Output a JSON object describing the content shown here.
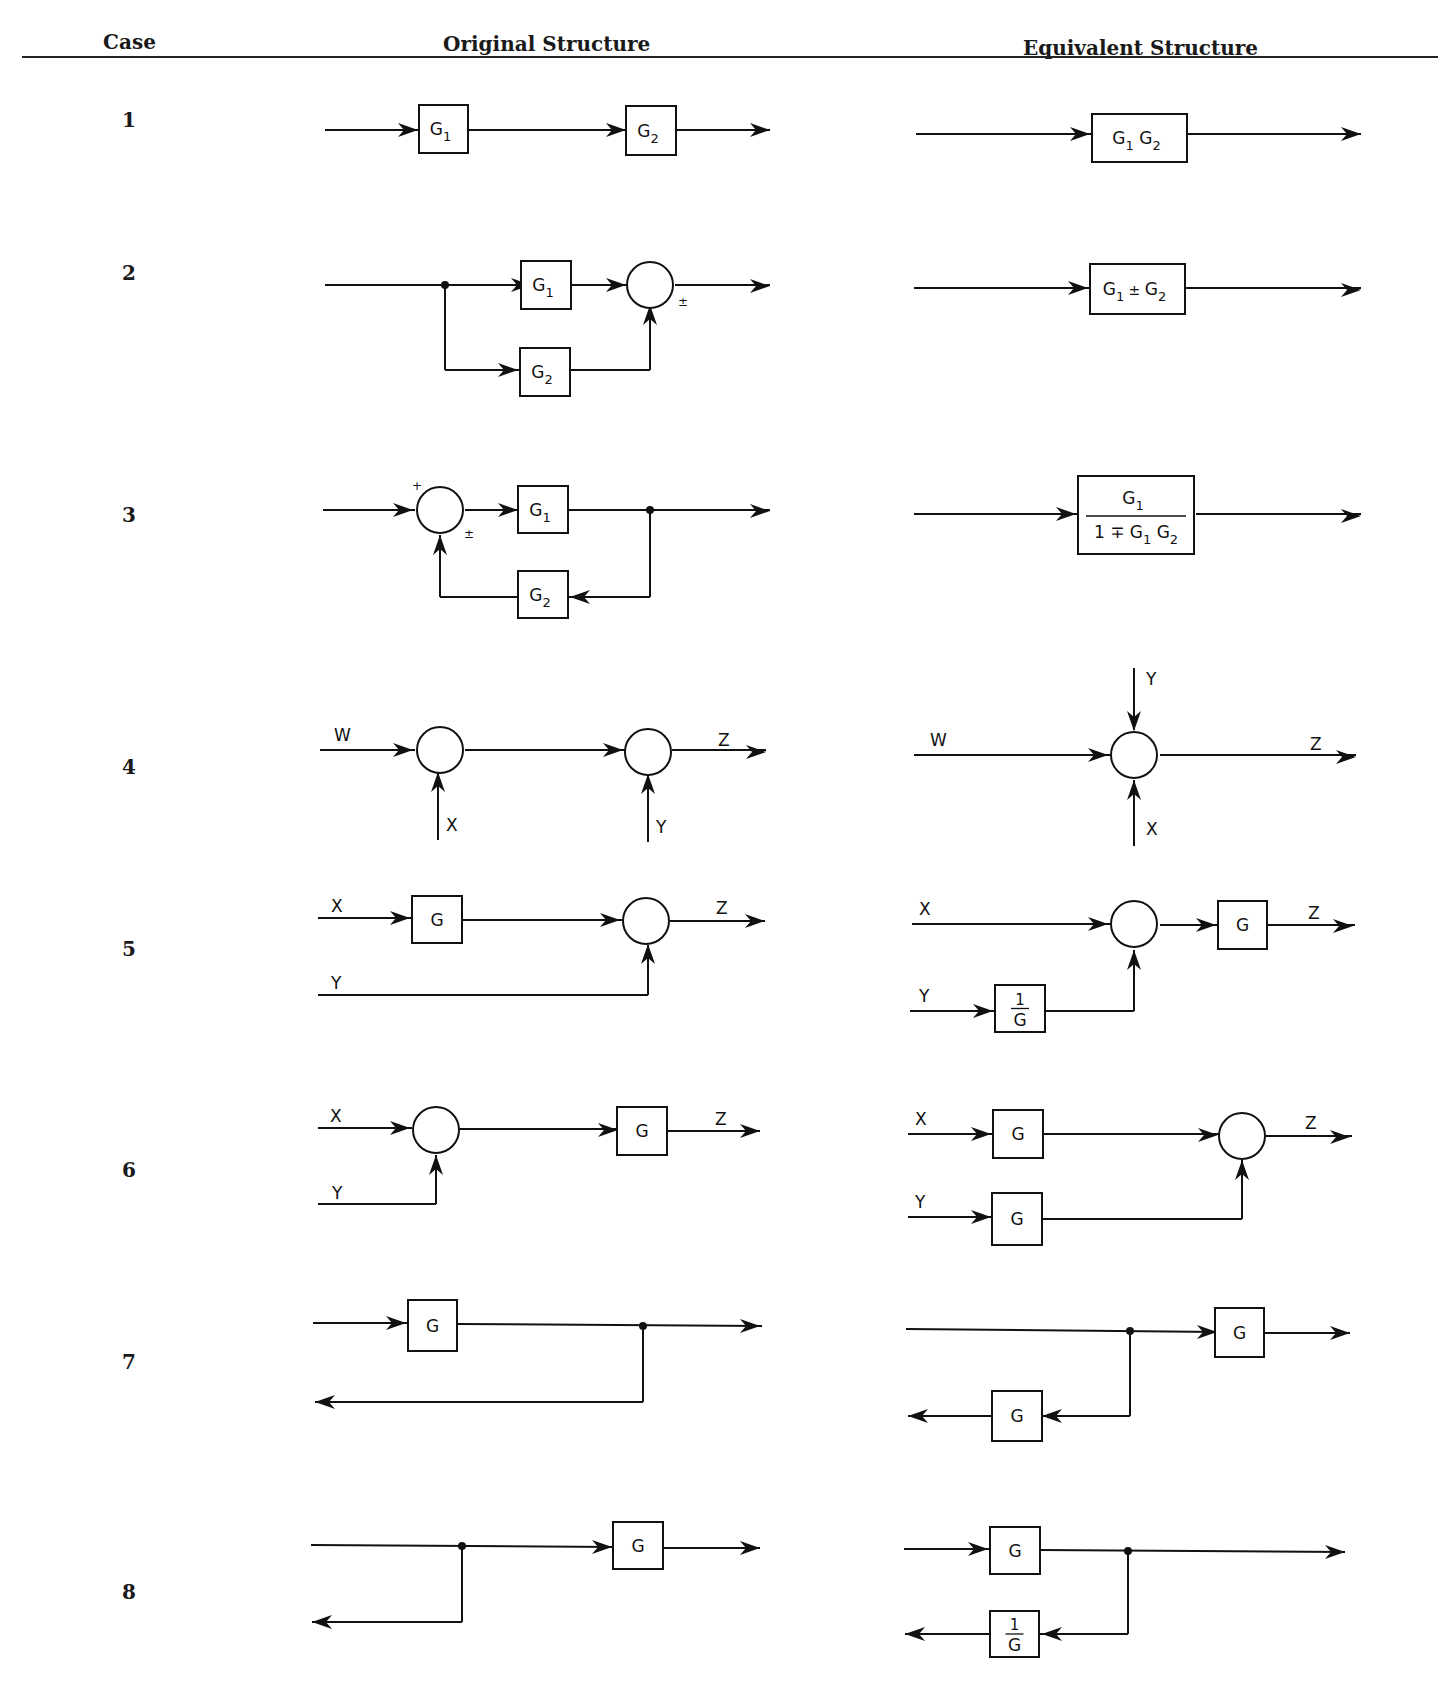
{
  "header": {
    "case_label": "Case",
    "original_label": "Original Structure",
    "equivalent_label": "Equivalent Structure"
  },
  "cases": [
    {
      "number": "1",
      "y": 122
    },
    {
      "number": "2",
      "y": 275
    },
    {
      "number": "3",
      "y": 517
    },
    {
      "number": "4",
      "y": 769
    },
    {
      "number": "5",
      "y": 951
    },
    {
      "number": "6",
      "y": 1172
    },
    {
      "number": "7",
      "y": 1364
    },
    {
      "number": "8",
      "y": 1594
    }
  ],
  "diagram": {
    "stroke": "#111111",
    "lines": [
      [
        325,
        130,
        420,
        130
      ],
      [
        467,
        130,
        628,
        130
      ],
      [
        676,
        130,
        770,
        130
      ],
      [
        916,
        134,
        1092,
        134
      ],
      [
        1187,
        134,
        1361,
        134
      ],
      [
        325,
        285,
        533,
        285
      ],
      [
        445,
        285,
        445,
        370
      ],
      [
        445,
        370,
        520,
        370
      ],
      [
        568,
        285,
        628,
        285
      ],
      [
        567,
        370,
        650,
        370
      ],
      [
        650,
        370,
        650,
        318
      ],
      [
        675,
        285,
        770,
        285
      ],
      [
        914,
        288,
        1090,
        288
      ],
      [
        1185,
        288,
        1361,
        288
      ],
      [
        323,
        510,
        415,
        510
      ],
      [
        465,
        510,
        520,
        510
      ],
      [
        568,
        510,
        770,
        510
      ],
      [
        650,
        510,
        650,
        597
      ],
      [
        650,
        597,
        568,
        597
      ],
      [
        520,
        597,
        440,
        597
      ],
      [
        440,
        597,
        440,
        535
      ],
      [
        914,
        514,
        1078,
        514
      ],
      [
        1196,
        514,
        1361,
        514
      ],
      [
        320,
        750,
        415,
        750
      ],
      [
        465,
        750,
        625,
        750
      ],
      [
        672,
        750,
        766,
        750
      ],
      [
        438,
        840,
        438,
        773
      ],
      [
        648,
        842,
        648,
        775
      ],
      [
        914,
        755,
        1110,
        755
      ],
      [
        1160,
        755,
        1356,
        755
      ],
      [
        1134,
        668,
        1134,
        730
      ],
      [
        1134,
        846,
        1134,
        780
      ],
      [
        318,
        918,
        412,
        918
      ],
      [
        463,
        920,
        622,
        920
      ],
      [
        670,
        921,
        765,
        921
      ],
      [
        318,
        995,
        648,
        995
      ],
      [
        648,
        995,
        648,
        945
      ],
      [
        912,
        924,
        1110,
        924
      ],
      [
        1160,
        925,
        1218,
        925
      ],
      [
        1267,
        925,
        1355,
        925
      ],
      [
        910,
        1011,
        995,
        1011
      ],
      [
        1045,
        1011,
        1134,
        1011
      ],
      [
        1134,
        1011,
        1134,
        950
      ],
      [
        318,
        1128,
        412,
        1128
      ],
      [
        458,
        1129,
        620,
        1129
      ],
      [
        667,
        1131,
        760,
        1131
      ],
      [
        318,
        1204,
        436,
        1204
      ],
      [
        436,
        1204,
        436,
        1155
      ],
      [
        908,
        1134,
        993,
        1134
      ],
      [
        1043,
        1134,
        1220,
        1134
      ],
      [
        1265,
        1136,
        1352,
        1136
      ],
      [
        908,
        1217,
        993,
        1217
      ],
      [
        1043,
        1219,
        1242,
        1219
      ],
      [
        1242,
        1219,
        1242,
        1160
      ],
      [
        313,
        1323,
        408,
        1323
      ],
      [
        457,
        1324,
        762,
        1326
      ],
      [
        643,
        1326,
        643,
        1402
      ],
      [
        643,
        1402,
        315,
        1402
      ],
      [
        906,
        1329,
        1219,
        1332
      ],
      [
        1265,
        1333,
        1350,
        1333
      ],
      [
        1130,
        1331,
        1130,
        1416
      ],
      [
        1130,
        1416,
        1040,
        1416
      ],
      [
        992,
        1416,
        908,
        1416
      ],
      [
        311,
        1545,
        614,
        1547
      ],
      [
        462,
        1546,
        462,
        1622
      ],
      [
        462,
        1622,
        312,
        1622
      ],
      [
        662,
        1548,
        760,
        1548
      ],
      [
        904,
        1549,
        990,
        1549
      ],
      [
        1040,
        1550,
        1345,
        1552
      ],
      [
        1128,
        1551,
        1128,
        1634
      ],
      [
        1128,
        1634,
        1040,
        1634
      ],
      [
        990,
        1634,
        905,
        1634
      ]
    ],
    "arrows": [
      [
        418,
        130,
        "r"
      ],
      [
        626,
        130,
        "r"
      ],
      [
        770,
        130,
        "r"
      ],
      [
        1090,
        134,
        "r"
      ],
      [
        1361,
        134,
        "r"
      ],
      [
        531,
        285,
        "r"
      ],
      [
        518,
        370,
        "r"
      ],
      [
        626,
        285,
        "r"
      ],
      [
        650,
        305,
        "u"
      ],
      [
        770,
        286,
        "r"
      ],
      [
        1088,
        288,
        "r"
      ],
      [
        1361,
        290,
        "r"
      ],
      [
        413,
        510,
        "r"
      ],
      [
        518,
        510,
        "r"
      ],
      [
        770,
        511,
        "r"
      ],
      [
        570,
        597,
        "l"
      ],
      [
        440,
        535,
        "u"
      ],
      [
        1076,
        514,
        "r"
      ],
      [
        1361,
        516,
        "r"
      ],
      [
        413,
        750,
        "r"
      ],
      [
        623,
        750,
        "r"
      ],
      [
        766,
        752,
        "r"
      ],
      [
        438,
        772,
        "u"
      ],
      [
        648,
        774,
        "u"
      ],
      [
        1108,
        755,
        "r"
      ],
      [
        1356,
        757,
        "r"
      ],
      [
        1134,
        731,
        "d"
      ],
      [
        1134,
        780,
        "u"
      ],
      [
        410,
        918,
        "r"
      ],
      [
        620,
        920,
        "r"
      ],
      [
        765,
        921,
        "r"
      ],
      [
        648,
        944,
        "u"
      ],
      [
        1108,
        924,
        "r"
      ],
      [
        1216,
        925,
        "r"
      ],
      [
        1353,
        926,
        "r"
      ],
      [
        993,
        1011,
        "r"
      ],
      [
        1134,
        950,
        "u"
      ],
      [
        410,
        1128,
        "r"
      ],
      [
        618,
        1130,
        "r"
      ],
      [
        760,
        1131,
        "r"
      ],
      [
        436,
        1155,
        "u"
      ],
      [
        991,
        1134,
        "r"
      ],
      [
        1218,
        1135,
        "r"
      ],
      [
        1350,
        1137,
        "r"
      ],
      [
        991,
        1217,
        "r"
      ],
      [
        1242,
        1160,
        "u"
      ],
      [
        406,
        1323,
        "r"
      ],
      [
        760,
        1326,
        "r"
      ],
      [
        315,
        1402,
        "l"
      ],
      [
        1217,
        1332,
        "r"
      ],
      [
        1350,
        1333,
        "r"
      ],
      [
        1042,
        1416,
        "l"
      ],
      [
        908,
        1416,
        "l"
      ],
      [
        612,
        1547,
        "r"
      ],
      [
        760,
        1548,
        "r"
      ],
      [
        312,
        1622,
        "l"
      ],
      [
        988,
        1549,
        "r"
      ],
      [
        1345,
        1552,
        "r"
      ],
      [
        1042,
        1634,
        "l"
      ],
      [
        905,
        1634,
        "l"
      ]
    ],
    "dots": [
      [
        445,
        285
      ],
      [
        650,
        510
      ],
      [
        643,
        1326
      ],
      [
        1130,
        1331
      ],
      [
        462,
        1546
      ],
      [
        1128,
        1551
      ]
    ],
    "circles": [
      [
        650,
        285,
        23
      ],
      [
        440,
        510,
        23
      ],
      [
        440,
        750,
        23
      ],
      [
        648,
        752,
        23
      ],
      [
        1134,
        755,
        23
      ],
      [
        646,
        921,
        23
      ],
      [
        1134,
        924,
        23
      ],
      [
        436,
        1130,
        23
      ],
      [
        1242,
        1136,
        23
      ]
    ],
    "boxes": [
      {
        "x": 419,
        "y": 105,
        "w": 49,
        "h": 48,
        "main": "G",
        "sub": "1"
      },
      {
        "x": 626,
        "y": 106,
        "w": 50,
        "h": 49,
        "main": "G",
        "sub": "2"
      },
      {
        "x": 1092,
        "y": 114,
        "w": 95,
        "h": 48,
        "main": "G",
        "sub": "1",
        "main2": "G",
        "sub2": "2"
      },
      {
        "x": 521,
        "y": 261,
        "w": 50,
        "h": 48,
        "main": "G",
        "sub": "1"
      },
      {
        "x": 520,
        "y": 348,
        "w": 50,
        "h": 48,
        "main": "G",
        "sub": "2"
      },
      {
        "x": 1090,
        "y": 264,
        "w": 95,
        "h": 50,
        "main": "G",
        "sub": "1",
        "mid": " ± ",
        "main2": "G",
        "sub2": "2"
      },
      {
        "x": 518,
        "y": 486,
        "w": 50,
        "h": 47,
        "main": "G",
        "sub": "1"
      },
      {
        "x": 518,
        "y": 571,
        "w": 50,
        "h": 47,
        "main": "G",
        "sub": "2"
      },
      {
        "x": 412,
        "y": 896,
        "w": 50,
        "h": 47,
        "main": "G"
      },
      {
        "x": 1218,
        "y": 901,
        "w": 49,
        "h": 48,
        "main": "G"
      },
      {
        "x": 995,
        "y": 985,
        "w": 50,
        "h": 47,
        "frac_num": "1",
        "frac_den": "G"
      },
      {
        "x": 617,
        "y": 1107,
        "w": 50,
        "h": 48,
        "main": "G"
      },
      {
        "x": 993,
        "y": 1110,
        "w": 50,
        "h": 48,
        "main": "G"
      },
      {
        "x": 992,
        "y": 1193,
        "w": 50,
        "h": 52,
        "main": "G"
      },
      {
        "x": 408,
        "y": 1300,
        "w": 49,
        "h": 51,
        "main": "G"
      },
      {
        "x": 1215,
        "y": 1308,
        "w": 49,
        "h": 49,
        "main": "G"
      },
      {
        "x": 992,
        "y": 1391,
        "w": 50,
        "h": 50,
        "main": "G"
      },
      {
        "x": 613,
        "y": 1522,
        "w": 50,
        "h": 47,
        "main": "G"
      },
      {
        "x": 990,
        "y": 1527,
        "w": 50,
        "h": 47,
        "main": "G"
      },
      {
        "x": 990,
        "y": 1611,
        "w": 49,
        "h": 46,
        "frac_num": "1",
        "frac_den": "G"
      }
    ],
    "big_fraction_box": {
      "x": 1078,
      "y": 476,
      "w": 116,
      "h": 78,
      "num_main": "G",
      "num_sub": "1",
      "den": "1 ∓ G",
      "den_sub1": "1",
      "den_mid": " G",
      "den_sub2": "2"
    },
    "labels": [
      {
        "x": 412,
        "y": 490,
        "t": "+",
        "cls": "small"
      },
      {
        "x": 678,
        "y": 306,
        "t": "±",
        "cls": "small"
      },
      {
        "x": 464,
        "y": 538,
        "t": "±",
        "cls": "small"
      },
      {
        "x": 334,
        "y": 741,
        "t": "W",
        "cls": "lbl"
      },
      {
        "x": 446,
        "y": 831,
        "t": "X",
        "cls": "lbl"
      },
      {
        "x": 656,
        "y": 833,
        "t": "Y",
        "cls": "lbl"
      },
      {
        "x": 718,
        "y": 746,
        "t": "Z",
        "cls": "lbl"
      },
      {
        "x": 930,
        "y": 746,
        "t": "W",
        "cls": "lbl"
      },
      {
        "x": 1146,
        "y": 685,
        "t": "Y",
        "cls": "lbl"
      },
      {
        "x": 1146,
        "y": 835,
        "t": "X",
        "cls": "lbl"
      },
      {
        "x": 1310,
        "y": 750,
        "t": "Z",
        "cls": "lbl"
      },
      {
        "x": 331,
        "y": 912,
        "t": "X",
        "cls": "lbl"
      },
      {
        "x": 331,
        "y": 989,
        "t": "Y",
        "cls": "lbl"
      },
      {
        "x": 716,
        "y": 914,
        "t": "Z",
        "cls": "lbl"
      },
      {
        "x": 919,
        "y": 915,
        "t": "X",
        "cls": "lbl"
      },
      {
        "x": 919,
        "y": 1002,
        "t": "Y",
        "cls": "lbl"
      },
      {
        "x": 1308,
        "y": 919,
        "t": "Z",
        "cls": "lbl"
      },
      {
        "x": 330,
        "y": 1122,
        "t": "X",
        "cls": "lbl"
      },
      {
        "x": 332,
        "y": 1199,
        "t": "Y",
        "cls": "lbl"
      },
      {
        "x": 715,
        "y": 1125,
        "t": "Z",
        "cls": "lbl"
      },
      {
        "x": 915,
        "y": 1125,
        "t": "X",
        "cls": "lbl"
      },
      {
        "x": 915,
        "y": 1208,
        "t": "Y",
        "cls": "lbl"
      },
      {
        "x": 1305,
        "y": 1129,
        "t": "Z",
        "cls": "lbl"
      }
    ]
  }
}
